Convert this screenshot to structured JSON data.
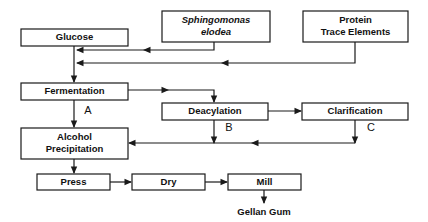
{
  "diagram": {
    "type": "process-flowchart",
    "background_color": "#ffffff",
    "line_color": "#1a1a1a",
    "text_color": "#111111",
    "nodes": [
      {
        "id": "glucose",
        "label": "Glucose",
        "lines": [
          "Glucose"
        ],
        "italic": false,
        "x": 21,
        "y": 29,
        "w": 107,
        "h": 17
      },
      {
        "id": "sphingomonas",
        "label": "Sphingomonas elodea",
        "lines": [
          "Sphingomonas",
          "elodea"
        ],
        "italic": true,
        "x": 162,
        "y": 11,
        "w": 108,
        "h": 31
      },
      {
        "id": "protein",
        "label": "Protein Trace Elements",
        "lines": [
          "Protein",
          "Trace Elements"
        ],
        "italic": false,
        "x": 303,
        "y": 11,
        "w": 105,
        "h": 31
      },
      {
        "id": "fermentation",
        "label": "Fermentation",
        "lines": [
          "Fermentation"
        ],
        "italic": false,
        "x": 21,
        "y": 83,
        "w": 107,
        "h": 17
      },
      {
        "id": "deacylation",
        "label": "Deacylation",
        "lines": [
          "Deacylation"
        ],
        "italic": false,
        "x": 162,
        "y": 103,
        "w": 106,
        "h": 17
      },
      {
        "id": "clarification",
        "label": "Clarification",
        "lines": [
          "Clarification"
        ],
        "italic": false,
        "x": 302,
        "y": 103,
        "w": 106,
        "h": 17
      },
      {
        "id": "alcohol-precipitation",
        "label": "Alcohol Precipitation",
        "lines": [
          "Alcohol",
          "Precipitation"
        ],
        "italic": false,
        "x": 21,
        "y": 128,
        "w": 107,
        "h": 31
      },
      {
        "id": "press",
        "label": "Press",
        "lines": [
          "Press"
        ],
        "italic": false,
        "x": 37,
        "y": 174,
        "w": 73,
        "h": 16
      },
      {
        "id": "dry",
        "label": "Dry",
        "lines": [
          "Dry"
        ],
        "italic": false,
        "x": 132,
        "y": 174,
        "w": 73,
        "h": 16
      },
      {
        "id": "mill",
        "label": "Mill",
        "lines": [
          "Mill"
        ],
        "italic": false,
        "x": 228,
        "y": 174,
        "w": 73,
        "h": 16
      }
    ],
    "step_letters": [
      {
        "id": "step-a",
        "label": "A",
        "x": 88,
        "y": 111
      },
      {
        "id": "step-b",
        "label": "B",
        "x": 229,
        "y": 128
      },
      {
        "id": "step-c",
        "label": "C",
        "x": 371,
        "y": 128
      }
    ],
    "output": {
      "id": "gellan-gum-output",
      "label": "Gellan Gum",
      "x": 264,
      "y": 212
    },
    "connectors": [
      {
        "id": "sphingomonas-to-glucose",
        "from": "sphingomonas",
        "to": "glucose-fermentation-line",
        "path": "M 214 42 L 214 50 L 77 50",
        "arrow": {
          "x": 77,
          "y": 50,
          "dir": "left"
        },
        "mid_arrow": {
          "x": 144,
          "y": 50,
          "dir": "left"
        }
      },
      {
        "id": "protein-to-glucose",
        "from": "protein",
        "to": "glucose-fermentation-line",
        "path": "M 355 42 L 355 63 L 77 63",
        "arrow": {
          "x": 77,
          "y": 63,
          "dir": "left"
        },
        "mid_arrow": {
          "x": 222,
          "y": 63,
          "dir": "left"
        }
      },
      {
        "id": "glucose-to-fermentation",
        "from": "glucose",
        "to": "fermentation",
        "path": "M 74 46 L 74 82",
        "arrow": {
          "x": 74,
          "y": 82,
          "dir": "down"
        }
      },
      {
        "id": "fermentation-to-deacylation",
        "from": "fermentation",
        "to": "deacylation",
        "path": "M 128 90 L 214 90 L 214 102",
        "arrow": {
          "x": 214,
          "y": 102,
          "dir": "down"
        },
        "mid_arrow": {
          "x": 168,
          "y": 90,
          "dir": "right"
        }
      },
      {
        "id": "fermentation-to-alcohol-precipitation",
        "from": "fermentation",
        "to": "alcohol-precipitation",
        "path": "M 74 100 L 74 127",
        "arrow": {
          "x": 74,
          "y": 127,
          "dir": "down"
        },
        "label": "A"
      },
      {
        "id": "deacylation-to-clarification",
        "from": "deacylation",
        "to": "clarification",
        "path": "M 268 111 L 301 111",
        "arrow": {
          "x": 301,
          "y": 111,
          "dir": "right"
        }
      },
      {
        "id": "deacylation-to-merge",
        "from": "deacylation",
        "to": "alcohol-precipitation",
        "path": "M 214 120 L 214 143",
        "arrow": {
          "x": 214,
          "y": 143,
          "dir": "down"
        },
        "label": "B"
      },
      {
        "id": "clarification-to-merge",
        "from": "clarification",
        "to": "alcohol-precipitation",
        "path": "M 355 120 L 355 143",
        "arrow": {
          "x": 355,
          "y": 143,
          "dir": "down"
        },
        "label": "C"
      },
      {
        "id": "merge-to-alcohol-precipitation",
        "from": "merge-line",
        "to": "alcohol-precipitation",
        "path": "M 355 143 L 129 143",
        "arrow": {
          "x": 129,
          "y": 143,
          "dir": "left"
        },
        "mid_arrow": {
          "x": 252,
          "y": 143,
          "dir": "left"
        }
      },
      {
        "id": "alcohol-precipitation-to-press",
        "from": "alcohol-precipitation",
        "to": "press",
        "path": "M 74 159 L 74 173",
        "arrow": {
          "x": 74,
          "y": 173,
          "dir": "down"
        }
      },
      {
        "id": "press-to-dry",
        "from": "press",
        "to": "dry",
        "path": "M 110 182 L 131 182",
        "arrow": {
          "x": 131,
          "y": 182,
          "dir": "right"
        }
      },
      {
        "id": "dry-to-mill",
        "from": "dry",
        "to": "mill",
        "path": "M 205 182 L 227 182",
        "arrow": {
          "x": 227,
          "y": 182,
          "dir": "right"
        }
      },
      {
        "id": "mill-to-gellan-gum",
        "from": "mill",
        "to": "gellan-gum-output",
        "path": "M 264 190 L 264 203",
        "arrow": {
          "x": 264,
          "y": 203,
          "dir": "down"
        }
      }
    ]
  }
}
